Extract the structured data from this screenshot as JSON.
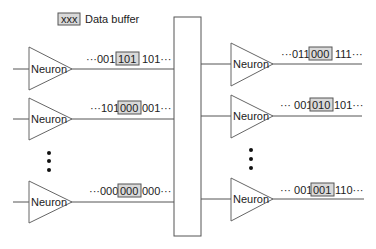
{
  "legend": {
    "sample": "xxx",
    "label": "Data buffer",
    "buffer_color": "#d9d9d9"
  },
  "neuron_label": "Neuron",
  "left_neurons": [
    {
      "label": "Neuron",
      "prefix": "···001",
      "buffer": "101",
      "suffix": "101···"
    },
    {
      "label": "Neuron",
      "prefix": "···101",
      "buffer": "000",
      "suffix": "001···"
    },
    {
      "label": "Neuron",
      "prefix": "···000",
      "buffer": "000",
      "suffix": "000···"
    }
  ],
  "right_neurons": [
    {
      "label": "Neuron",
      "prefix": "···011",
      "buffer": "000",
      "suffix": "111···"
    },
    {
      "label": "Neuron",
      "prefix": "··· 001",
      "buffer": "010",
      "suffix": "101···"
    },
    {
      "label": "Neuron",
      "prefix": "··· 001",
      "buffer": "001",
      "suffix": "110···"
    }
  ],
  "ellipsis_left": "vertical-dots",
  "ellipsis_right": "vertical-dots",
  "bus": {
    "name": "interconnect-bus"
  }
}
